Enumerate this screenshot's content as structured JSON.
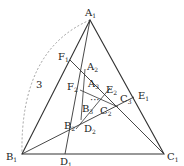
{
  "diagram": {
    "type": "nested triangles with cevians",
    "side_label": "3",
    "ellipsis": "···",
    "points": {
      "A1": {
        "label": "A",
        "sub": "1",
        "x": 90,
        "y": 20
      },
      "B1": {
        "label": "B",
        "sub": "1",
        "x": 22,
        "y": 154
      },
      "C1": {
        "label": "C",
        "sub": "1",
        "x": 164,
        "y": 154
      },
      "D1": {
        "label": "D",
        "sub": "1",
        "x": 65,
        "y": 154
      },
      "E1": {
        "label": "E",
        "sub": "1",
        "x": 134,
        "y": 97
      },
      "F1": {
        "label": "F",
        "sub": "1",
        "x": 70,
        "y": 60
      },
      "A2": {
        "label": "A",
        "sub": "2",
        "x": 85,
        "y": 69
      },
      "B2": {
        "label": "B",
        "sub": "2",
        "x": 76,
        "y": 129
      },
      "C2": {
        "label": "C",
        "sub": "2",
        "x": 118,
        "y": 107
      },
      "D2": {
        "label": "D",
        "sub": "2",
        "x": 81,
        "y": 120
      },
      "E2": {
        "label": "E",
        "sub": "2",
        "x": 110,
        "y": 88
      },
      "F2": {
        "label": "F",
        "sub": "2",
        "x": 80,
        "y": 90
      },
      "A3": {
        "label": "A",
        "sub": "3",
        "x": 92,
        "y": 88
      },
      "B3": {
        "label": "B",
        "sub": "3",
        "x": 87,
        "y": 112
      },
      "C3": {
        "label": "C",
        "sub": "3",
        "x": 104,
        "y": 105
      }
    }
  }
}
